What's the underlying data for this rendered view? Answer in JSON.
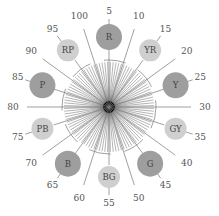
{
  "diagram": {
    "center": {
      "x": 109,
      "y": 107
    },
    "ray_count": 100,
    "ray_inner_radius": 0,
    "ray_outer_radius": 45,
    "labeled_ray_radius": 82,
    "arc_radius": 47,
    "label_radius": 96,
    "circle_ring_radius": 70,
    "colors": {
      "ray": "#222222",
      "labeled_ray": "#777777",
      "arc": "#888888",
      "principal_fill": "#9e9e9e",
      "intermediate_fill": "#cfcfcf",
      "text": "#555555"
    },
    "tick_labels": [
      "5",
      "10",
      "15",
      "20",
      "25",
      "30",
      "35",
      "40",
      "45",
      "50",
      "55",
      "60",
      "65",
      "70",
      "75",
      "80",
      "85",
      "90",
      "95",
      "100"
    ],
    "hues": [
      {
        "name": "R",
        "position": 5,
        "type": "principal"
      },
      {
        "name": "YR",
        "position": 15,
        "type": "intermediate"
      },
      {
        "name": "Y",
        "position": 25,
        "type": "principal"
      },
      {
        "name": "GY",
        "position": 35,
        "type": "intermediate"
      },
      {
        "name": "G",
        "position": 45,
        "type": "principal"
      },
      {
        "name": "BG",
        "position": 55,
        "type": "intermediate"
      },
      {
        "name": "B",
        "position": 65,
        "type": "principal"
      },
      {
        "name": "PB",
        "position": 75,
        "type": "intermediate"
      },
      {
        "name": "P",
        "position": 85,
        "type": "principal"
      },
      {
        "name": "RP",
        "position": 95,
        "type": "intermediate"
      }
    ]
  }
}
